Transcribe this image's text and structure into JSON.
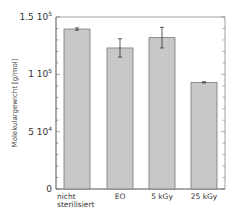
{
  "chart_data": {
    "type": "bar",
    "title": "",
    "xlabel": "",
    "ylabel": "Molekulargewicht [g/mol]",
    "categories": [
      "nicht sterilisiert",
      "EO",
      "5 kGy",
      "25 kGy"
    ],
    "category_lines": [
      [
        "nicht",
        "sterilisiert"
      ],
      [
        "EO"
      ],
      [
        "5 kGy"
      ],
      [
        "25 kGy"
      ]
    ],
    "values": [
      139500,
      123000,
      132000,
      93000
    ],
    "errors": [
      1000,
      8000,
      9000,
      500
    ],
    "ylim": [
      0,
      150000
    ],
    "yticks": [
      {
        "value": 0,
        "base": "0",
        "exp": ""
      },
      {
        "value": 50000,
        "base": "5 10",
        "exp": "4"
      },
      {
        "value": 100000,
        "base": "1 10",
        "exp": "5"
      },
      {
        "value": 150000,
        "base": "1.5 10",
        "exp": "5"
      }
    ],
    "minor_tick_step": 10000,
    "grid": false,
    "legend": null,
    "bar_color": "#c8c8c8",
    "bar_edge_color": "#777777"
  }
}
